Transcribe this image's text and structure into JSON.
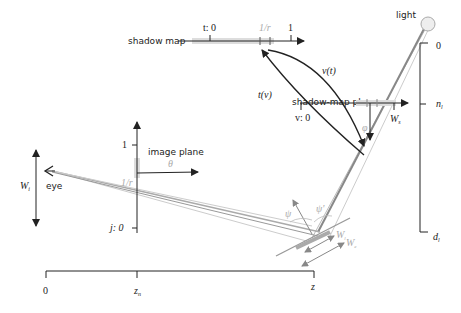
{
  "labels": {
    "light": "light",
    "shadow_map": "shadow map",
    "shadow_map_plane": "shadow-map plane",
    "image_plane": "image plane",
    "eye": "eye"
  },
  "shadow_map_axis": {
    "t_start": "t: 0",
    "one_over_r": "1/r",
    "r_sub": "t",
    "t_end": "1"
  },
  "mapping": {
    "v_of_t": "v(t)",
    "t_of_v": "t(v)"
  },
  "shadow_plane_axis": {
    "v_start": "v: 0",
    "w_end": "W",
    "w_sub": "s",
    "phi": "φ"
  },
  "image_plane_axis": {
    "top": "1",
    "bottom": "j: 0",
    "one_over_r": "1/r",
    "theta": "θ"
  },
  "eye_width": {
    "label": "W",
    "sub": "i"
  },
  "right_scale": {
    "top": "0",
    "mid": "n",
    "mid_sub": "l",
    "bottom": "d",
    "bottom_sub": "l"
  },
  "surface": {
    "psi": "ψ",
    "psi_prime": "ψ'",
    "w_l": "W",
    "w_l_sub": "l",
    "w_e": "W",
    "w_e_sub": "e"
  },
  "depth_axis": {
    "origin": "0",
    "z_n": "z",
    "z_n_sub": "n",
    "z": "z"
  },
  "colors": {
    "line": "#222222",
    "gray": "#999999",
    "light_gray": "#cccccc",
    "highlight": "#d9d9d9"
  }
}
